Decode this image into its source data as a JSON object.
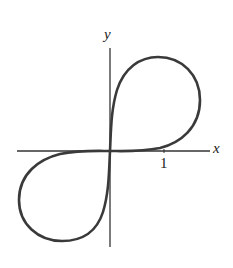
{
  "figure": {
    "type": "curve-plot",
    "axes": {
      "x_label": "x",
      "y_label": "y",
      "x_tick_labels": [
        "1"
      ]
    },
    "curve": {
      "description": "Figure-eight shaped curve with lobes in quadrants I and III, passing through origin tangent to both axes",
      "stroke_color": "#3a3a3a"
    },
    "colors": {
      "axis": "#333333",
      "background": "#ffffff"
    }
  }
}
